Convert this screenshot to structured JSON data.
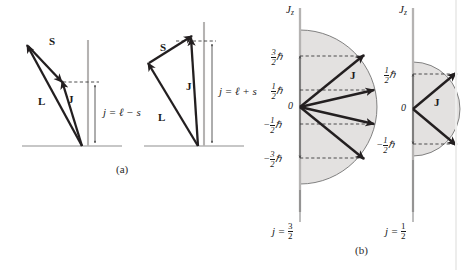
{
  "figure": {
    "panel_a": {
      "caption": "(a)",
      "diagrams": [
        {
          "id": "antiparallel",
          "equation_plain": "j = ℓ − s",
          "equation_lhs": "j",
          "equation_eq": "=",
          "equation_l": "ℓ",
          "equation_op": "−",
          "equation_s": "s",
          "vectors": [
            {
              "name": "S",
              "label": "S"
            },
            {
              "name": "L",
              "label": "L"
            },
            {
              "name": "J",
              "label": "J"
            }
          ]
        },
        {
          "id": "parallel",
          "equation_plain": "j = ℓ + s",
          "equation_lhs": "j",
          "equation_eq": "=",
          "equation_l": "ℓ",
          "equation_op": "+",
          "equation_s": "s",
          "vectors": [
            {
              "name": "S",
              "label": "S"
            },
            {
              "name": "L",
              "label": "L"
            },
            {
              "name": "J",
              "label": "J"
            }
          ]
        }
      ]
    },
    "panel_b": {
      "caption": "(b)",
      "diagrams": [
        {
          "id": "j-three-halves",
          "axis_label_main": "J",
          "axis_label_sub": "z",
          "j_caption_lhs": "j",
          "j_caption_eq": "=",
          "j_caption_num": "3",
          "j_caption_den": "2",
          "origin_label": "0",
          "vector_label": "J",
          "ticks": [
            {
              "sign": "",
              "num": "3",
              "den": "2",
              "unit": "ℏ",
              "value": 1.5
            },
            {
              "sign": "",
              "num": "1",
              "den": "2",
              "unit": "ℏ",
              "value": 0.5
            },
            {
              "sign": "",
              "num": "",
              "den": "",
              "unit": "0",
              "value": 0
            },
            {
              "sign": "−",
              "num": "1",
              "den": "2",
              "unit": "ℏ",
              "value": -0.5
            },
            {
              "sign": "−",
              "num": "3",
              "den": "2",
              "unit": "ℏ",
              "value": -1.5
            }
          ],
          "m_j_values": [
            1.5,
            0.5,
            -0.5,
            -1.5
          ]
        },
        {
          "id": "j-one-half",
          "axis_label_main": "J",
          "axis_label_sub": "z",
          "j_caption_lhs": "j",
          "j_caption_eq": "=",
          "j_caption_num": "1",
          "j_caption_den": "2",
          "origin_label": "0",
          "vector_label": "J",
          "ticks": [
            {
              "sign": "",
              "num": "1",
              "den": "2",
              "unit": "ℏ",
              "value": 0.5
            },
            {
              "sign": "",
              "num": "",
              "den": "",
              "unit": "0",
              "value": 0
            },
            {
              "sign": "−",
              "num": "1",
              "den": "2",
              "unit": "ℏ",
              "value": -0.5
            }
          ],
          "m_j_values": [
            0.5,
            -0.5
          ]
        }
      ]
    },
    "colors": {
      "vector_stroke": "#231f20",
      "axis_gray": "#a8a8a8",
      "shade_fill": "#e3e1e0",
      "circle_stroke": "#6d6d6d",
      "dashed_stroke": "#3a3a3a",
      "text": "#1a1a1a",
      "background": "#ffffff"
    }
  }
}
